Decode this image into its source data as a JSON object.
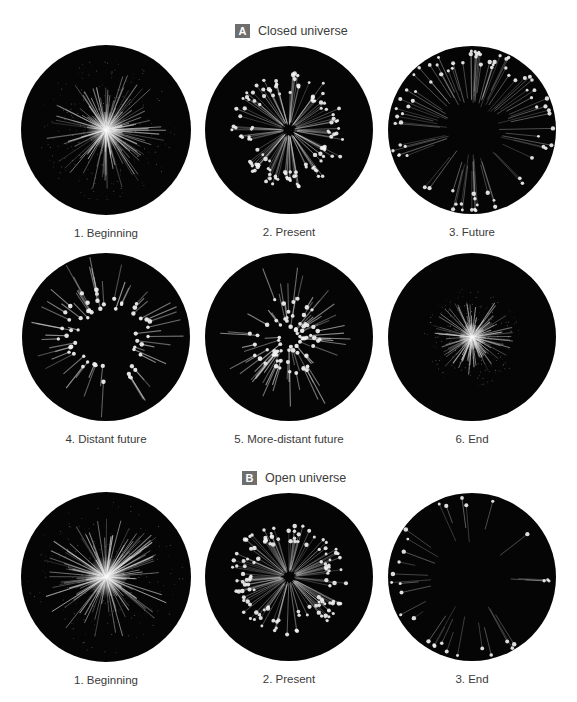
{
  "sections": [
    {
      "id": "A",
      "badge": "A",
      "title": "Closed universe",
      "title_pos": {
        "x": 235,
        "y": 24
      },
      "panels": [
        {
          "caption": "1. Beginning",
          "style": "burst",
          "cx": 106,
          "cy": 130,
          "r": 85,
          "burst_r": 55,
          "seed": 11
        },
        {
          "caption": "2. Present",
          "style": "ring",
          "cx": 289,
          "cy": 130,
          "r": 84,
          "inner": 8,
          "outer": 58,
          "count": 120,
          "seed": 23
        },
        {
          "caption": "3. Future",
          "style": "ring",
          "cx": 472,
          "cy": 130,
          "r": 84,
          "inner": 40,
          "outer": 82,
          "count": 80,
          "seed": 37
        },
        {
          "caption": "4. Distant future",
          "style": "inward",
          "cx": 106,
          "cy": 337,
          "r": 84,
          "inner": 26,
          "outer": 50,
          "count": 55,
          "seed": 41
        },
        {
          "caption": "5. More-distant future",
          "style": "inward",
          "cx": 289,
          "cy": 337,
          "r": 84,
          "inner": 8,
          "outer": 40,
          "count": 70,
          "seed": 53
        },
        {
          "caption": "6. End",
          "style": "burst",
          "cx": 472,
          "cy": 337,
          "r": 84,
          "burst_r": 38,
          "seed": 67
        }
      ],
      "caption_rows": [
        225,
        432
      ]
    },
    {
      "id": "B",
      "badge": "B",
      "title": "Open universe",
      "title_pos": {
        "x": 242,
        "y": 471
      },
      "panels": [
        {
          "caption": "1. Beginning",
          "style": "burst",
          "cx": 106,
          "cy": 577,
          "r": 85,
          "burst_r": 60,
          "seed": 79
        },
        {
          "caption": "2. Present",
          "style": "ring",
          "cx": 289,
          "cy": 577,
          "r": 84,
          "inner": 8,
          "outer": 58,
          "count": 120,
          "seed": 83
        },
        {
          "caption": "3. End",
          "style": "ring",
          "cx": 472,
          "cy": 577,
          "r": 84,
          "inner": 55,
          "outer": 82,
          "count": 30,
          "seed": 97
        }
      ],
      "caption_rows": [
        672
      ]
    }
  ],
  "colors": {
    "disc": "#050505",
    "star": "#f4f4f4",
    "ray": "#d8d8d8",
    "badge": "#6e6e6e",
    "text": "#3a3a3a"
  }
}
